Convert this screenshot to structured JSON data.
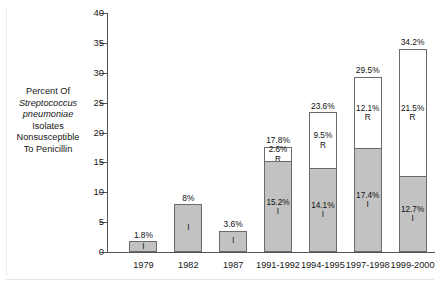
{
  "chart_data": {
    "type": "bar",
    "subtype": "stacked-bar",
    "title": "",
    "xlabel": "",
    "ylabel": "Percent Of Streptococcus pneumoniae Isolates Nonsusceptible To Penicillin",
    "ylabel_lines": [
      {
        "text": "Percent Of",
        "italic": false
      },
      {
        "text": "Streptococcus",
        "italic": true
      },
      {
        "text": "pneumoniae",
        "italic": true
      },
      {
        "text": "Isolates",
        "italic": false
      },
      {
        "text": "Nonsusceptible",
        "italic": false
      },
      {
        "text": "To Penicillin",
        "italic": false
      }
    ],
    "ylim": [
      0,
      40
    ],
    "ytick_step": 5,
    "yticks": [
      40,
      35,
      30,
      25,
      20,
      15,
      10,
      5,
      0
    ],
    "ytick_labels": [
      "40",
      "35",
      "30",
      "25",
      "20",
      "15",
      "10",
      "5",
      "0"
    ],
    "grid": false,
    "legend": "none",
    "categories": [
      "1979",
      "1982",
      "1987",
      "1991-1992",
      "1994-1995",
      "1997-1998",
      "1999-2000"
    ],
    "series": [
      {
        "name": "I",
        "code": "I",
        "description": "Intermediate",
        "color": "#c2c2c2",
        "values": [
          1.8,
          8.0,
          3.6,
          15.2,
          14.1,
          17.4,
          12.7
        ],
        "value_labels": [
          "1.8%",
          "8%",
          "3.6%",
          "15.2%",
          "14.1%",
          "17.4%",
          "12.7%"
        ]
      },
      {
        "name": "R",
        "code": "R",
        "description": "Resistant",
        "color": "#ffffff",
        "values": [
          0,
          0,
          0,
          2.6,
          9.5,
          12.1,
          21.5
        ],
        "value_labels": [
          "",
          "",
          "",
          "2.6%",
          "9.5%",
          "12.1%",
          "21.5%"
        ]
      }
    ],
    "totals": [
      1.8,
      8.0,
      3.6,
      17.8,
      23.6,
      29.5,
      34.2
    ],
    "total_labels": [
      "",
      "8%",
      "3.6%",
      "17.8%",
      "23.6%",
      "29.5%",
      "34.2%"
    ],
    "bars": [
      {
        "category": "1979",
        "total": 1.8,
        "total_label": "",
        "segments": [
          {
            "code": "I",
            "value": 1.8,
            "label": "1.8%",
            "label_position": "above",
            "fill": "#c2c2c2"
          }
        ]
      },
      {
        "category": "1982",
        "total": 8.0,
        "total_label": "8%",
        "segments": [
          {
            "code": "I",
            "value": 8.0,
            "label": "",
            "label_position": "inside",
            "fill": "#c2c2c2"
          }
        ]
      },
      {
        "category": "1987",
        "total": 3.6,
        "total_label": "3.6%",
        "segments": [
          {
            "code": "I",
            "value": 3.6,
            "label": "",
            "label_position": "inside",
            "fill": "#c2c2c2"
          }
        ]
      },
      {
        "category": "1991-1992",
        "total": 17.8,
        "total_label": "17.8%",
        "segments": [
          {
            "code": "R",
            "value": 2.6,
            "label": "2.6%",
            "label_position": "inside",
            "fill": "#ffffff"
          },
          {
            "code": "I",
            "value": 15.2,
            "label": "15.2%",
            "label_position": "inside",
            "fill": "#c2c2c2"
          }
        ]
      },
      {
        "category": "1994-1995",
        "total": 23.6,
        "total_label": "23.6%",
        "segments": [
          {
            "code": "R",
            "value": 9.5,
            "label": "9.5%",
            "label_position": "inside",
            "fill": "#ffffff"
          },
          {
            "code": "I",
            "value": 14.1,
            "label": "14.1%",
            "label_position": "inside",
            "fill": "#c2c2c2"
          }
        ]
      },
      {
        "category": "1997-1998",
        "total": 29.5,
        "total_label": "29.5%",
        "segments": [
          {
            "code": "R",
            "value": 12.1,
            "label": "12.1%",
            "label_position": "inside",
            "fill": "#ffffff"
          },
          {
            "code": "I",
            "value": 17.4,
            "label": "17.4%",
            "label_position": "inside",
            "fill": "#c2c2c2"
          }
        ]
      },
      {
        "category": "1999-2000",
        "total": 34.2,
        "total_label": "34.2%",
        "segments": [
          {
            "code": "R",
            "value": 21.5,
            "label": "21.5%",
            "label_position": "inside",
            "fill": "#ffffff"
          },
          {
            "code": "I",
            "value": 12.7,
            "label": "12.7%",
            "label_position": "inside",
            "fill": "#c2c2c2"
          }
        ]
      }
    ],
    "colors": {
      "intermediate_fill": "#c2c2c2",
      "resistant_fill": "#ffffff",
      "bar_stroke": "#6b6b6b",
      "axis": "#555555",
      "text": "#161616",
      "background": "#ffffff"
    }
  }
}
